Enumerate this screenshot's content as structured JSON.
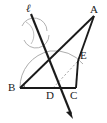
{
  "figure": {
    "type": "geometry-construction-diagram",
    "width": 107,
    "height": 123,
    "background_color": "#ffffff",
    "stroke_color": "#1a1a1a",
    "light_stroke_color": "#9a9a9a",
    "labels": {
      "line_l": "ℓ",
      "vertex_a": "A",
      "vertex_b": "B",
      "vertex_c": "C",
      "vertex_d": "D",
      "vertex_e": "E"
    },
    "label_positions": {
      "line_l": {
        "x": 26,
        "y": 4
      },
      "vertex_a": {
        "x": 91,
        "y": 4
      },
      "vertex_b": {
        "x": 9,
        "y": 82
      },
      "vertex_c": {
        "x": 71,
        "y": 90
      },
      "vertex_d": {
        "x": 47,
        "y": 90
      },
      "vertex_e": {
        "x": 79,
        "y": 50
      }
    },
    "points": {
      "A": {
        "x": 94,
        "y": 16
      },
      "B": {
        "x": 20,
        "y": 88
      },
      "C": {
        "x": 76,
        "y": 88
      },
      "D": {
        "x": 53,
        "y": 88
      },
      "E": {
        "x": 78,
        "y": 61
      }
    },
    "segments": [
      {
        "name": "segment-BA",
        "from": "B",
        "to": "A",
        "style": "solid",
        "weight": "thick"
      },
      {
        "name": "segment-BC",
        "from": "B",
        "to": "C",
        "style": "solid",
        "weight": "thick"
      },
      {
        "name": "segment-CE",
        "from": "C",
        "to": "E",
        "style": "solid",
        "weight": "thick"
      },
      {
        "name": "segment-EA",
        "from": "E",
        "to": "A",
        "style": "solid",
        "weight": "thick"
      },
      {
        "name": "segment-DE",
        "from": "D",
        "to": "E",
        "style": "dashed",
        "weight": "thin"
      }
    ],
    "line_l": {
      "name": "line-l",
      "start": {
        "x": 31,
        "y": 14
      },
      "end": {
        "x": 73,
        "y": 118
      },
      "arrowhead_at": "end",
      "passes_through": "D"
    },
    "arcs": {
      "main_arc": {
        "name": "arc-from-B",
        "description": "large thin arc centered near D sweeping from B up over to near E",
        "start": {
          "x": 20,
          "y": 88
        },
        "end": {
          "x": 82,
          "y": 63
        },
        "radius": 36
      },
      "construction_marks": [
        {
          "name": "construction-arc-upper",
          "cx": 35,
          "cy": 30,
          "r": 12
        },
        {
          "name": "construction-arc-lower",
          "cx": 37,
          "cy": 38,
          "r": 12
        }
      ]
    },
    "angle_mark": {
      "name": "angle-mark-B",
      "at": "B",
      "description": "small angle arc at vertex B"
    }
  }
}
